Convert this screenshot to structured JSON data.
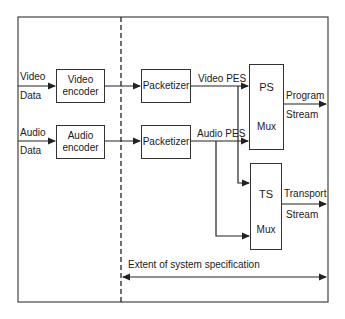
{
  "diagram": {
    "inputs": {
      "video": {
        "line1": "Video",
        "line2": "Data"
      },
      "audio": {
        "line1": "Audio",
        "line2": "Data"
      }
    },
    "encoders": {
      "video": {
        "line1": "Video",
        "line2": "encoder"
      },
      "audio": {
        "line1": "Audio",
        "line2": "encoder"
      }
    },
    "packetizers": {
      "video": {
        "label": "Packetizer"
      },
      "audio": {
        "label": "Packetizer"
      }
    },
    "streams": {
      "video_pes": "Video PES",
      "audio_pes": "Audio PES"
    },
    "muxes": {
      "ps": {
        "title": "PS",
        "sub": "Mux"
      },
      "ts": {
        "title": "TS",
        "sub": "Mux"
      }
    },
    "outputs": {
      "program": {
        "line1": "Program",
        "line2": "Stream"
      },
      "transport": {
        "line1": "Transport",
        "line2": "Stream"
      }
    },
    "extent_label": "Extent of system specification",
    "colors": {
      "line": "#333333",
      "background": "#ffffff"
    }
  }
}
